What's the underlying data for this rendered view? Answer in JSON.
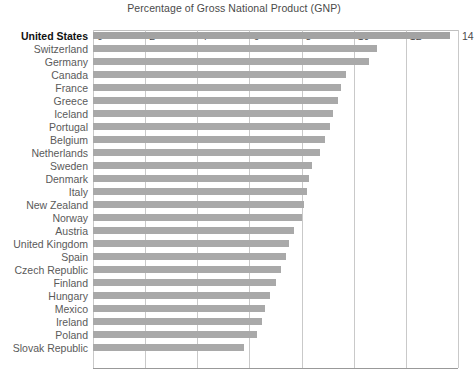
{
  "chart_data": {
    "type": "bar",
    "orientation": "horizontal",
    "title": "Percentage of Gross National Product (GNP)",
    "xlabel": "",
    "ylabel": "",
    "xlim": [
      0,
      14
    ],
    "xticks": [
      0,
      2,
      4,
      6,
      8,
      10,
      12,
      14
    ],
    "xtick_labels": [
      "0",
      "2",
      "4",
      "6",
      "8",
      "10",
      "12",
      "14"
    ],
    "grid": true,
    "legend": false,
    "bar_color": "#a9a9a9",
    "highlight_category": "United States",
    "categories": [
      "United States",
      "Switzerland",
      "Germany",
      "Canada",
      "France",
      "Greece",
      "Iceland",
      "Portugal",
      "Belgium",
      "Netherlands",
      "Sweden",
      "Denmark",
      "Italy",
      "New Zealand",
      "Norway",
      "Austria",
      "United Kingdom",
      "Spain",
      "Czech Republic",
      "Finland",
      "Hungary",
      "Mexico",
      "Ireland",
      "Poland",
      "Slovak Republic"
    ],
    "values": [
      13.7,
      10.9,
      10.6,
      9.7,
      9.5,
      9.4,
      9.2,
      9.1,
      8.9,
      8.7,
      8.4,
      8.3,
      8.2,
      8.1,
      8.0,
      7.7,
      7.5,
      7.4,
      7.2,
      7.0,
      6.8,
      6.6,
      6.5,
      6.3,
      5.8
    ]
  }
}
